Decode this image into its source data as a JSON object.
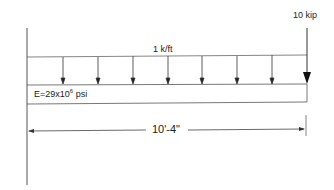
{
  "diagram": {
    "point_load": {
      "label": "10 kip"
    },
    "distributed_load": {
      "label": "1 k/ft",
      "arrow_count": 8
    },
    "beam": {
      "modulus_prefix": "E=29x10",
      "modulus_exp": "6",
      "modulus_suffix": " psi"
    },
    "dimension": {
      "label": "10'-4\""
    },
    "colors": {
      "line": "#333333",
      "background": "#ffffff"
    }
  }
}
